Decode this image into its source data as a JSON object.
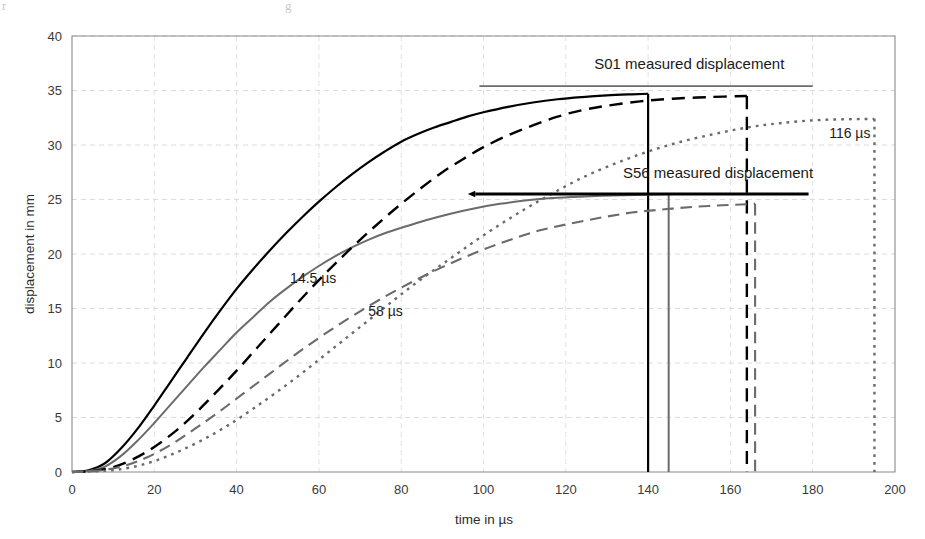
{
  "figure": {
    "background": "#ffffff",
    "width": 925,
    "height": 539
  },
  "chart_data": {
    "type": "line",
    "title": "",
    "xlabel": "time in µs",
    "ylabel": "displacement in mm",
    "xlim": [
      0,
      200
    ],
    "ylim": [
      0,
      40
    ],
    "xticks": [
      0,
      20,
      40,
      60,
      80,
      100,
      120,
      140,
      160,
      180,
      200
    ],
    "xtick_labels": [
      "0",
      "20",
      "40",
      "60",
      "80",
      "100",
      "120",
      "140",
      "160",
      "180",
      "200"
    ],
    "yticks": [
      0,
      5,
      10,
      15,
      20,
      25,
      30,
      35,
      40
    ],
    "ytick_labels": [
      "0",
      "5",
      "10",
      "15",
      "20",
      "25",
      "30",
      "35",
      "40"
    ],
    "grid": true,
    "grid_style": "dashed-light",
    "legend": "none",
    "series": [
      {
        "name": "14.5 µs",
        "style": "solid",
        "color": "#000000",
        "width": 2.2,
        "drop_at_x": 140,
        "drop_from_y": 34.7,
        "points": [
          [
            0,
            0.0
          ],
          [
            4,
            0.15
          ],
          [
            8,
            0.8
          ],
          [
            12,
            2.2
          ],
          [
            16,
            4.0
          ],
          [
            20,
            6.1
          ],
          [
            24,
            8.3
          ],
          [
            28,
            10.5
          ],
          [
            32,
            12.7
          ],
          [
            36,
            14.8
          ],
          [
            40,
            16.8
          ],
          [
            44,
            18.6
          ],
          [
            48,
            20.3
          ],
          [
            52,
            21.9
          ],
          [
            56,
            23.4
          ],
          [
            60,
            24.8
          ],
          [
            64,
            26.1
          ],
          [
            68,
            27.3
          ],
          [
            72,
            28.4
          ],
          [
            76,
            29.4
          ],
          [
            80,
            30.3
          ],
          [
            84,
            31.0
          ],
          [
            88,
            31.6
          ],
          [
            92,
            32.1
          ],
          [
            96,
            32.6
          ],
          [
            100,
            33.0
          ],
          [
            106,
            33.5
          ],
          [
            112,
            33.9
          ],
          [
            118,
            34.2
          ],
          [
            124,
            34.4
          ],
          [
            130,
            34.55
          ],
          [
            136,
            34.65
          ],
          [
            140,
            34.7
          ]
        ]
      },
      {
        "name": "58 µs",
        "style": "solid",
        "color": "#6b6b6b",
        "width": 2.0,
        "drop_at_x": 145,
        "drop_from_y": 25.5,
        "points": [
          [
            0,
            0.0
          ],
          [
            4,
            0.1
          ],
          [
            8,
            0.5
          ],
          [
            12,
            1.5
          ],
          [
            16,
            2.9
          ],
          [
            20,
            4.5
          ],
          [
            24,
            6.2
          ],
          [
            28,
            7.9
          ],
          [
            32,
            9.6
          ],
          [
            36,
            11.2
          ],
          [
            40,
            12.8
          ],
          [
            44,
            14.2
          ],
          [
            48,
            15.6
          ],
          [
            52,
            16.8
          ],
          [
            56,
            17.9
          ],
          [
            60,
            18.9
          ],
          [
            64,
            19.8
          ],
          [
            68,
            20.6
          ],
          [
            72,
            21.3
          ],
          [
            76,
            21.9
          ],
          [
            80,
            22.4
          ],
          [
            86,
            23.1
          ],
          [
            92,
            23.7
          ],
          [
            98,
            24.2
          ],
          [
            104,
            24.6
          ],
          [
            110,
            24.9
          ],
          [
            118,
            25.15
          ],
          [
            126,
            25.3
          ],
          [
            134,
            25.4
          ],
          [
            145,
            25.5
          ]
        ]
      },
      {
        "name": "dashed-black",
        "style": "dashed",
        "color": "#000000",
        "width": 2.4,
        "drop_at_x": 164,
        "drop_from_y": 34.5,
        "points": [
          [
            0,
            0.0
          ],
          [
            5,
            0.1
          ],
          [
            10,
            0.45
          ],
          [
            15,
            1.2
          ],
          [
            20,
            2.3
          ],
          [
            25,
            3.7
          ],
          [
            30,
            5.4
          ],
          [
            35,
            7.3
          ],
          [
            40,
            9.3
          ],
          [
            45,
            11.4
          ],
          [
            50,
            13.5
          ],
          [
            55,
            15.6
          ],
          [
            60,
            17.6
          ],
          [
            65,
            19.5
          ],
          [
            70,
            21.3
          ],
          [
            75,
            23.0
          ],
          [
            80,
            24.6
          ],
          [
            85,
            26.1
          ],
          [
            90,
            27.5
          ],
          [
            95,
            28.7
          ],
          [
            100,
            29.8
          ],
          [
            106,
            30.9
          ],
          [
            112,
            31.8
          ],
          [
            118,
            32.6
          ],
          [
            124,
            33.2
          ],
          [
            130,
            33.6
          ],
          [
            138,
            34.0
          ],
          [
            146,
            34.25
          ],
          [
            155,
            34.4
          ],
          [
            164,
            34.5
          ]
        ]
      },
      {
        "name": "dashed-gray",
        "style": "dashed",
        "color": "#6b6b6b",
        "width": 2.1,
        "drop_at_x": 166,
        "drop_from_y": 24.6,
        "points": [
          [
            0,
            0.0
          ],
          [
            6,
            0.1
          ],
          [
            12,
            0.5
          ],
          [
            18,
            1.3
          ],
          [
            24,
            2.5
          ],
          [
            30,
            4.0
          ],
          [
            36,
            5.6
          ],
          [
            42,
            7.3
          ],
          [
            48,
            9.0
          ],
          [
            54,
            10.7
          ],
          [
            60,
            12.3
          ],
          [
            66,
            13.8
          ],
          [
            72,
            15.2
          ],
          [
            78,
            16.5
          ],
          [
            84,
            17.7
          ],
          [
            90,
            18.8
          ],
          [
            96,
            19.8
          ],
          [
            102,
            20.7
          ],
          [
            108,
            21.5
          ],
          [
            114,
            22.2
          ],
          [
            120,
            22.7
          ],
          [
            128,
            23.3
          ],
          [
            136,
            23.8
          ],
          [
            144,
            24.1
          ],
          [
            152,
            24.35
          ],
          [
            160,
            24.5
          ],
          [
            166,
            24.6
          ]
        ]
      },
      {
        "name": "116 µs",
        "style": "dotted",
        "color": "#6b6b6b",
        "width": 2.4,
        "drop_at_x": 195,
        "drop_from_y": 32.4,
        "points": [
          [
            0,
            0.0
          ],
          [
            8,
            0.1
          ],
          [
            14,
            0.4
          ],
          [
            20,
            1.0
          ],
          [
            26,
            1.9
          ],
          [
            32,
            3.0
          ],
          [
            38,
            4.3
          ],
          [
            44,
            5.8
          ],
          [
            50,
            7.4
          ],
          [
            56,
            9.1
          ],
          [
            62,
            10.9
          ],
          [
            68,
            12.7
          ],
          [
            74,
            14.5
          ],
          [
            80,
            16.3
          ],
          [
            86,
            18.0
          ],
          [
            92,
            19.6
          ],
          [
            98,
            21.2
          ],
          [
            104,
            22.7
          ],
          [
            110,
            24.1
          ],
          [
            116,
            25.4
          ],
          [
            124,
            27.0
          ],
          [
            132,
            28.3
          ],
          [
            140,
            29.4
          ],
          [
            148,
            30.3
          ],
          [
            156,
            31.0
          ],
          [
            164,
            31.6
          ],
          [
            172,
            32.0
          ],
          [
            182,
            32.3
          ],
          [
            195,
            32.4
          ]
        ]
      }
    ],
    "annotations": [
      {
        "id": "s01-label",
        "text": "S01 measured displacement",
        "x": 150,
        "y": 37.0
      },
      {
        "id": "s56-label",
        "text": "S56 measured displacement",
        "x": 157,
        "y": 27.0
      },
      {
        "id": "label-14-5",
        "text": "14.5 µs",
        "x": 53,
        "y": 17.3
      },
      {
        "id": "label-58",
        "text": "58 µs",
        "x": 72,
        "y": 14.3
      },
      {
        "id": "label-116",
        "text": "116 µs",
        "x": 184,
        "y": 30.6
      }
    ],
    "reference_lines": [
      {
        "id": "s01-measured-line",
        "label": "S01 measured displacement",
        "y": 35.4,
        "x_start": 99,
        "x_end": 180,
        "color": "#6b6b6b",
        "width": 1.8,
        "arrow": false
      },
      {
        "id": "s56-measured-line",
        "label": "S56 measured displacement",
        "y": 25.5,
        "x_start": 98,
        "x_end": 179,
        "color": "#000000",
        "width": 3.0,
        "arrow": true
      }
    ]
  },
  "axes": {
    "y_title": "displacement in mm",
    "x_title": "time in µs"
  }
}
